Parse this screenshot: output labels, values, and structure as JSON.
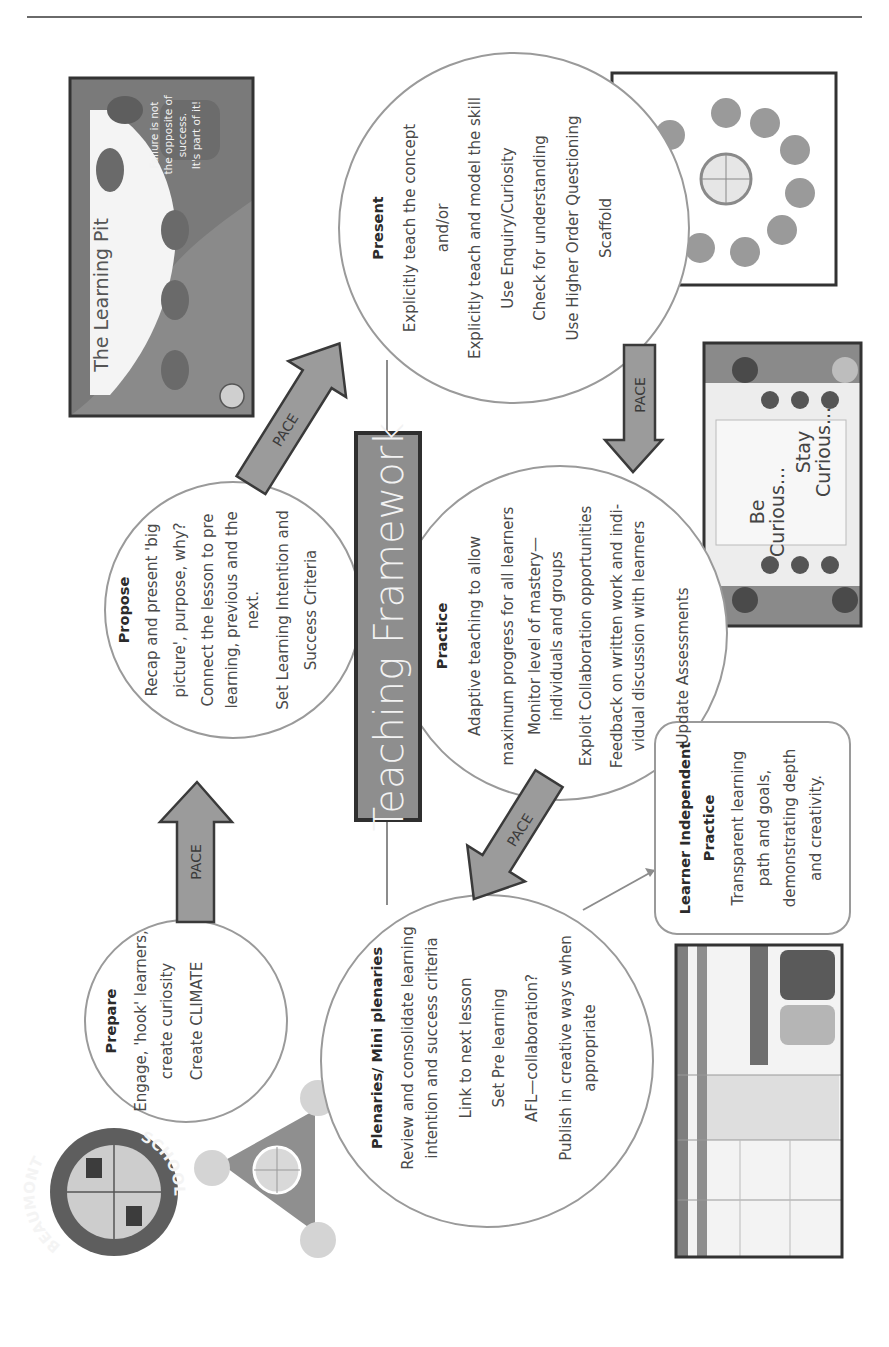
{
  "page": {
    "title": "Teaching Framework",
    "arrow_label": "PACE",
    "colors": {
      "arrow_fill": "#9b9b9b",
      "arrow_stroke": "#3a3a3a",
      "title_fill": "#8e8e8e",
      "circle_stroke": "#9a9a9a"
    }
  },
  "stages": {
    "prepare": {
      "heading": "Prepare",
      "lines": [
        "Engage, 'hook' learners,",
        "create curiosity",
        "Create CLIMATE"
      ]
    },
    "propose": {
      "heading": "Propose",
      "lines": [
        "Recap and present 'big",
        "picture', purpose, why?",
        "Connect the lesson to pre",
        "learning, previous and the",
        "next.",
        "Set Learning Intention and",
        "Success Criteria"
      ]
    },
    "present": {
      "heading": "Present",
      "lines": [
        "Explicitly teach the concept",
        "and/or",
        "Explicitly teach and model the skill",
        "Use Enquiry/Curiosity",
        "Check for understanding",
        "Use Higher Order Questioning",
        "Scaffold"
      ]
    },
    "practice": {
      "heading": "Practice",
      "lines": [
        "Adaptive teaching to allow",
        "maximum progress for all learners",
        "Monitor level of mastery—",
        "individuals and groups",
        "Exploit Collaboration opportunities",
        "Feedback on written work and indi-",
        "vidual discussion with learners",
        "Update Assessments"
      ]
    },
    "plenaries": {
      "heading": "Plenaries/ Mini plenaries",
      "lines": [
        "Review and consolidate learning",
        "intention and success criteria",
        "Link to next lesson",
        "Set Pre learning",
        "AFL—collaboration?",
        "Publish in creative ways when",
        "appropriate"
      ]
    },
    "independent": {
      "heading_line1": "Learner Independent",
      "heading_line2": "Practice",
      "lines": [
        "Transparent learning",
        "path and goals,",
        "demonstrating depth",
        "and creativity."
      ]
    }
  },
  "images": {
    "learning_pit": {
      "title": "The Learning Pit",
      "caption_lines": [
        "Failure is not",
        "the opposite of",
        "success.",
        "It's part of it!"
      ]
    },
    "be_curious": {
      "line1": "Be",
      "line2": "Curious...",
      "line3": "Stay",
      "line4": "Curious..."
    },
    "logo": {
      "top_text": "BEAUMONT",
      "bottom_text": "SCHOOL"
    }
  }
}
